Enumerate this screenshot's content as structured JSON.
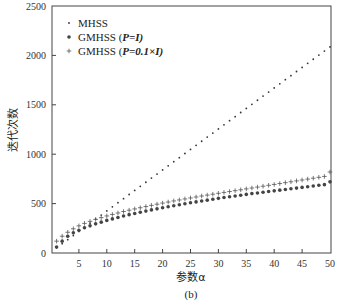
{
  "chart_data": {
    "type": "scatter",
    "title": "",
    "caption": "(b)",
    "xlabel": "参数α",
    "ylabel": "迭代次数",
    "xlim": [
      0,
      50
    ],
    "ylim": [
      0,
      2500
    ],
    "xticks": [
      5,
      10,
      15,
      20,
      25,
      30,
      35,
      40,
      45,
      50
    ],
    "yticks": [
      0,
      500,
      1000,
      1500,
      2000,
      2500
    ],
    "grid": false,
    "legend_position": "upper left",
    "x": [
      1,
      2,
      3,
      4,
      5,
      6,
      7,
      8,
      9,
      10,
      11,
      12,
      13,
      14,
      15,
      16,
      17,
      18,
      19,
      20,
      21,
      22,
      23,
      24,
      25,
      26,
      27,
      28,
      29,
      30,
      31,
      32,
      33,
      34,
      35,
      36,
      37,
      38,
      39,
      40,
      41,
      42,
      43,
      44,
      45,
      46,
      47,
      48,
      49,
      50
    ],
    "series": [
      {
        "name": "MHSS",
        "marker": "small-dot",
        "values": [
          52,
          94,
          135,
          177,
          218,
          260,
          301,
          343,
          384,
          426,
          467,
          509,
          550,
          592,
          633,
          675,
          716,
          758,
          799,
          841,
          882,
          924,
          965,
          1007,
          1048,
          1090,
          1131,
          1173,
          1214,
          1256,
          1297,
          1339,
          1380,
          1422,
          1463,
          1505,
          1546,
          1588,
          1629,
          1671,
          1712,
          1754,
          1795,
          1837,
          1878,
          1920,
          1961,
          2003,
          2044,
          2086
        ]
      },
      {
        "name": "GMHSS (P=I)",
        "marker": "large-dot",
        "values": [
          60,
          120,
          170,
          205,
          230,
          255,
          275,
          295,
          312,
          330,
          345,
          360,
          375,
          388,
          400,
          412,
          424,
          436,
          447,
          458,
          468,
          478,
          488,
          498,
          508,
          517,
          526,
          535,
          544,
          553,
          561,
          569,
          577,
          585,
          593,
          601,
          608,
          615,
          622,
          629,
          636,
          643,
          650,
          657,
          664,
          671,
          678,
          685,
          692,
          720
        ]
      },
      {
        "name": "GMHSS (P=0.1×I)",
        "marker": "plus",
        "values": [
          120,
          170,
          210,
          245,
          275,
          300,
          320,
          340,
          358,
          375,
          390,
          405,
          420,
          433,
          446,
          458,
          470,
          482,
          494,
          505,
          516,
          527,
          537,
          547,
          557,
          567,
          577,
          586,
          595,
          604,
          613,
          622,
          631,
          640,
          649,
          658,
          667,
          676,
          685,
          694,
          703,
          712,
          721,
          730,
          739,
          748,
          757,
          766,
          775,
          820
        ]
      }
    ]
  },
  "legend": {
    "items": [
      {
        "label_prefix": "MHSS",
        "label_suffix": ""
      },
      {
        "label_prefix": "GMHSS (",
        "label_suffix": "P=I)"
      },
      {
        "label_prefix": "GMHSS (",
        "label_suffix": "P=0.1×I)"
      }
    ]
  }
}
